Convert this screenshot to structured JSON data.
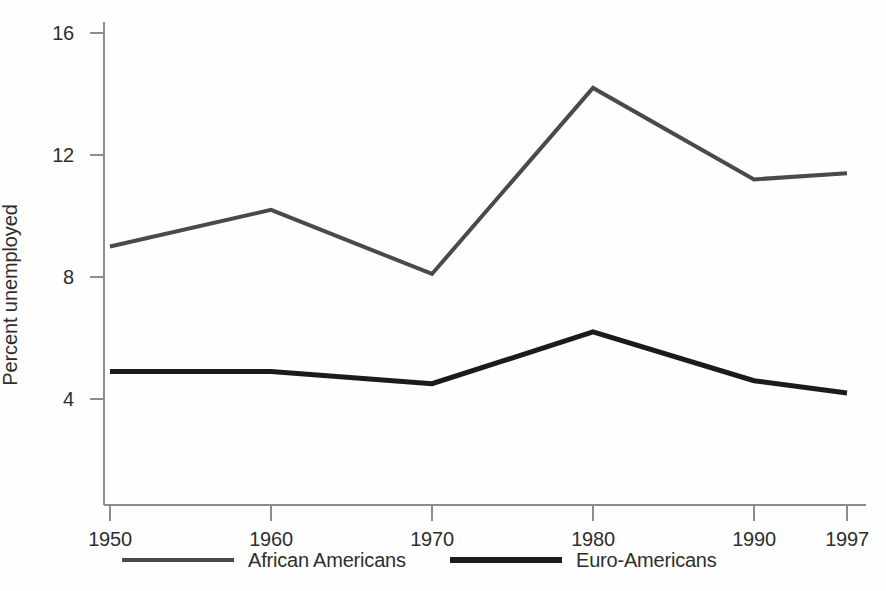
{
  "chart_data": {
    "type": "line",
    "title": "",
    "xlabel": "",
    "ylabel": "Percent unemployed",
    "x": [
      1950,
      1960,
      1970,
      1980,
      1990,
      1997
    ],
    "xtick_labels": [
      "1950",
      "1960",
      "1970",
      "1980",
      "1990",
      "1997"
    ],
    "ytick_labels": [
      "4",
      "8",
      "12",
      "16"
    ],
    "yticks": [
      4,
      8,
      12,
      16
    ],
    "ylim": [
      0,
      17
    ],
    "xlim": [
      1950,
      1997
    ],
    "grid": false,
    "legend_position": "bottom",
    "series": [
      {
        "name": "African Americans",
        "color": "#4a4a4a",
        "values": [
          9.0,
          10.2,
          8.1,
          14.2,
          11.2,
          11.4
        ]
      },
      {
        "name": "Euro-Americans",
        "color": "#1b1b1b",
        "values": [
          4.9,
          4.9,
          4.5,
          6.2,
          4.6,
          4.2
        ]
      }
    ]
  },
  "axis": {
    "y_title": "Percent unemployed",
    "y_ticks": [
      {
        "label": "16"
      },
      {
        "label": "12"
      },
      {
        "label": "8"
      },
      {
        "label": "4"
      }
    ],
    "x_ticks": [
      {
        "label": "1950"
      },
      {
        "label": "1960"
      },
      {
        "label": "1970"
      },
      {
        "label": "1980"
      },
      {
        "label": "1990"
      },
      {
        "label": "1997"
      }
    ]
  },
  "legend": {
    "items": [
      {
        "label": "African Americans"
      },
      {
        "label": "Euro-Americans"
      }
    ]
  }
}
